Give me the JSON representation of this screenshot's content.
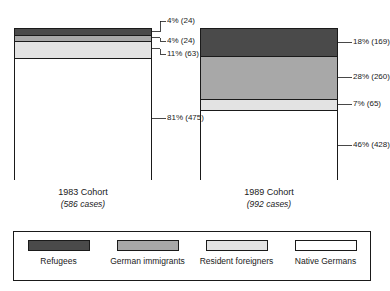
{
  "chart_data": {
    "type": "bar",
    "subtype": "100% stacked column",
    "title": "",
    "xlabel": "",
    "ylabel": "",
    "ylim": [
      0,
      100
    ],
    "grid": false,
    "legend_position": "bottom",
    "categories": [
      "1983 Cohort",
      "1989 Cohort"
    ],
    "series": [
      {
        "name": "Refugees",
        "color": "#4a4a4a",
        "values": [
          4,
          18
        ],
        "counts": [
          24,
          169
        ]
      },
      {
        "name": "German immigrants",
        "color": "#a8a8a8",
        "values": [
          4,
          28
        ],
        "counts": [
          24,
          260
        ]
      },
      {
        "name": "Resident foreigners",
        "color": "#e3e3e3",
        "values": [
          11,
          7
        ],
        "counts": [
          63,
          65
        ]
      },
      {
        "name": "Native Germans",
        "color": "#ffffff",
        "values": [
          81,
          46
        ],
        "counts": [
          475,
          428
        ]
      }
    ],
    "cohorts": [
      {
        "id": "1983",
        "name": "1983 Cohort",
        "cases_label": "(586 cases)",
        "total": 586,
        "segments": [
          {
            "key": "refugees",
            "label": "4% (24)",
            "percent": 4,
            "count": 24
          },
          {
            "key": "german_immigrants",
            "label": "4% (24)",
            "percent": 4,
            "count": 24
          },
          {
            "key": "resident_foreigners",
            "label": "11% (63)",
            "percent": 11,
            "count": 63
          },
          {
            "key": "native_germans",
            "label": "81% (475)",
            "percent": 81,
            "count": 475
          }
        ]
      },
      {
        "id": "1989",
        "name": "1989 Cohort",
        "cases_label": "(992 cases)",
        "total": 992,
        "segments": [
          {
            "key": "refugees",
            "label": "18% (169)",
            "percent": 18,
            "count": 169
          },
          {
            "key": "german_immigrants",
            "label": "28% (260)",
            "percent": 28,
            "count": 260
          },
          {
            "key": "resident_foreigners",
            "label": "7% (65)",
            "percent": 7,
            "count": 65
          },
          {
            "key": "native_germans",
            "label": "46% (428)",
            "percent": 46,
            "count": 428
          }
        ]
      }
    ]
  },
  "legend": {
    "items": [
      {
        "label": "Refugees",
        "color": "#4a4a4a"
      },
      {
        "label": "German immigrants",
        "color": "#a8a8a8"
      },
      {
        "label": "Resident foreigners",
        "color": "#e3e3e3"
      },
      {
        "label": "Native Germans",
        "color": "#ffffff"
      }
    ]
  }
}
